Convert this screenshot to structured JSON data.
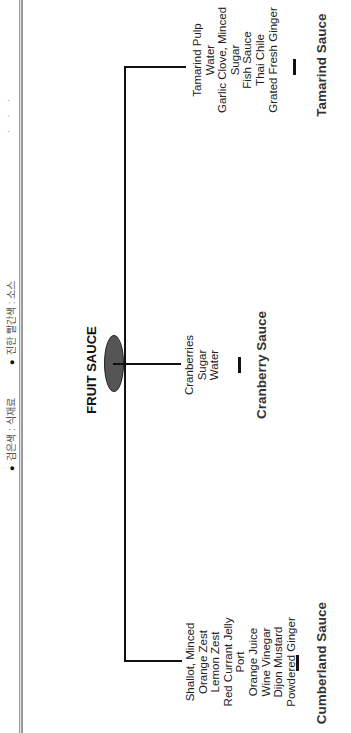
{
  "legend": {
    "items": [
      {
        "label": "검은색 : 식재료",
        "meaning": "black = ingredients"
      },
      {
        "label": "진한 빨간색 : 소스",
        "meaning": "dark red = sauce"
      }
    ],
    "bullet": "●"
  },
  "diagram": {
    "root": {
      "label": "FRUIT SAUCE",
      "node_color": "#555555"
    },
    "branches": [
      {
        "sauce": "Cumberland Sauce",
        "ingredients": [
          "Shallot, Minced",
          "Orange Zest",
          "Lemon Zest",
          "Red Currant Jelly",
          "Port",
          "Orange Juice",
          "Wine Vinegar",
          "Dijon Mustard",
          "Powdered Ginger"
        ]
      },
      {
        "sauce": "Cranberry Sauce",
        "ingredients": [
          "Cranberries",
          "Sugar",
          "Water"
        ]
      },
      {
        "sauce": "Tamarind Sauce",
        "ingredients": [
          "Tamarind Pulp",
          "Water",
          "Garlic Clove, Minced",
          "Sugar",
          "Fish Sauce",
          "Thai Chile",
          "Grated Fresh Ginger"
        ]
      }
    ]
  },
  "colors": {
    "line": "#111111",
    "ingredient_text": "#222222",
    "sauce_text": "#333333",
    "divider": "#9a9a9a"
  }
}
